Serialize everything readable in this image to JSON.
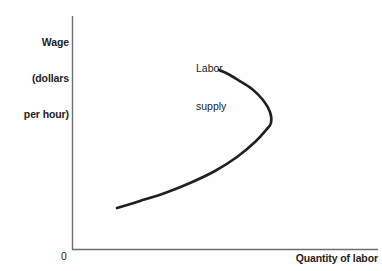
{
  "figure": {
    "background_color": "#fefefe",
    "ink_color": "#231f20",
    "axis_color": "#58595b"
  },
  "axes": {
    "origin_label": "0",
    "y_axis_title_lines": [
      "Wage",
      "(dollars",
      "per hour)"
    ],
    "x_axis_title": "Quantity of labor"
  },
  "annotations": {
    "curve_label_lines": [
      "Labor",
      "supply"
    ]
  },
  "chart_data": {
    "type": "line",
    "title": "",
    "xlabel": "Quantity of labor",
    "ylabel": "Wage (dollars per hour)",
    "xlim": [
      0,
      1
    ],
    "ylim": [
      0,
      1
    ],
    "grid": false,
    "legend": "none",
    "axis_ticks": {
      "x": [],
      "y": []
    },
    "series": [
      {
        "name": "Labor supply",
        "description": "Backward-bending labor supply curve: wage rises with quantity of labor supplied up to a maximum quantity, after which further wage increases reduce the quantity of labor supplied.",
        "annotation": "Labor supply",
        "stroke_color": "#231f20",
        "stroke_width": 2.6,
        "points_px": [
          [
            117,
            208
          ],
          [
            140,
            201
          ],
          [
            165,
            193
          ],
          [
            190,
            183
          ],
          [
            215,
            171
          ],
          [
            237,
            157
          ],
          [
            255,
            142
          ],
          [
            266,
            130
          ],
          [
            271,
            123
          ],
          [
            270,
            112
          ],
          [
            263,
            100
          ],
          [
            252,
            89
          ],
          [
            238,
            80
          ],
          [
            228,
            74
          ],
          [
            219,
            70
          ]
        ],
        "max_quantity_point_px": [
          271,
          123
        ],
        "lower_endpoint_px": [
          117,
          208
        ],
        "upper_endpoint_px": [
          219,
          70
        ]
      }
    ]
  }
}
